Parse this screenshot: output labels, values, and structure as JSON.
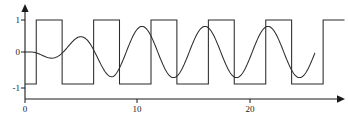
{
  "figure": {
    "name": "square-wave-and-growing-sine-plot",
    "background_color": "#ffffff",
    "line_color": "#2b2b2b",
    "axis_color": "#1a1a1a"
  },
  "axes": {
    "y_axis_label_top": "1",
    "y_axis_label_mid": "0",
    "y_axis_label_bottom": "-1",
    "x_axis_tick_0": "0",
    "x_axis_tick_10": "10",
    "x_axis_tick_20": "20"
  },
  "chart_data": {
    "type": "line",
    "title": "",
    "xlabel": "",
    "ylabel": "",
    "xlim": [
      0,
      28.5
    ],
    "ylim": [
      -1.35,
      1.35
    ],
    "grid": false,
    "legend": "none",
    "x_ticks": [
      0,
      10,
      20
    ],
    "x_tick_labels": [
      "0",
      "10",
      "20"
    ],
    "y_ticks": [
      -1,
      0,
      1
    ],
    "y_tick_labels": [
      "-1",
      "0",
      "1"
    ],
    "axis_arrows": {
      "x": "right",
      "y": "up"
    },
    "series": [
      {
        "name": "square-wave",
        "kind": "square",
        "amplitude": 1,
        "period": 5.1,
        "phase_rising_edge_x": 1.0,
        "duty_cycle": 0.5,
        "description": "Square wave alternating between +1 and -1, rising edge near x=1, half-period 2.55",
        "transitions_x": [
          1.0,
          3.3,
          6.1,
          8.4,
          11.2,
          13.5,
          16.3,
          18.6,
          21.4,
          23.7,
          26.5
        ],
        "values_between": [
          -1,
          1,
          -1,
          1,
          -1,
          1,
          -1,
          1,
          -1,
          1,
          -1,
          1
        ]
      },
      {
        "name": "growing-sine",
        "kind": "sine-amplitude-ramp",
        "max_amplitude": 0.8,
        "period": 5.6,
        "description": "Sinusoid starting at zero amplitude near x=0, amplitude ramping up to about 0.8 and then steady",
        "x": [
          0,
          1,
          2,
          3,
          4,
          5,
          6,
          7,
          8,
          9,
          10,
          11,
          12,
          13,
          14,
          15,
          16,
          17,
          18,
          19,
          20,
          21,
          22,
          23,
          24,
          25,
          26
        ],
        "y": [
          0,
          0,
          -0.12,
          -0.2,
          0.22,
          0.5,
          0.33,
          -0.45,
          -0.78,
          -0.43,
          0.45,
          0.78,
          0.5,
          -0.3,
          -0.75,
          -0.78,
          -0.1,
          0.68,
          0.78,
          0.3,
          -0.55,
          -0.8,
          -0.45,
          0.35,
          0.78,
          0.6,
          -0.15
        ]
      }
    ]
  }
}
